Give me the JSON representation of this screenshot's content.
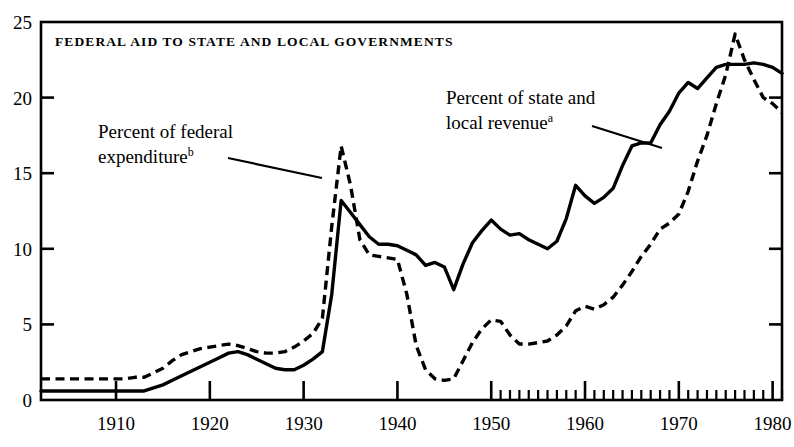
{
  "chart_data": {
    "type": "line",
    "title": "FEDERAL AID TO STATE AND LOCAL GOVERNMENTS",
    "xlabel": "",
    "ylabel": "",
    "xlim": [
      1902,
      1981
    ],
    "ylim": [
      0,
      25
    ],
    "grid": false,
    "legend_position": "inline-annotations",
    "y_ticks": [
      0,
      5,
      10,
      15,
      20,
      25
    ],
    "y_tick_labels": [
      "0",
      "5",
      "10",
      "15",
      "20",
      "25"
    ],
    "x_ticks_major": [
      1910,
      1920,
      1930,
      1940,
      1950,
      1960,
      1970,
      1980
    ],
    "x_tick_labels": [
      "1910",
      "1920",
      "1930",
      "1940",
      "1950",
      "1960",
      "1970",
      "1980"
    ],
    "x_minor_ticks_note": "annual minor ticks from 1950 to 1981",
    "x_minor_tick_start": 1950,
    "x_minor_tick_end": 1981,
    "annotations": [
      {
        "name": "percent-of-federal-expenditure",
        "line1": "Percent of federal",
        "line2": "expenditure",
        "superscript": "b",
        "series_ref": "percent_of_federal_expenditure"
      },
      {
        "name": "percent-of-state-and-local-revenue",
        "line1": "Percent of state and",
        "line2": "local revenue",
        "superscript": "a",
        "series_ref": "percent_of_state_and_local_revenue"
      }
    ],
    "series": [
      {
        "name": "percent_of_state_and_local_revenue",
        "label": "Percent of state and local revenue",
        "style": "solid",
        "color": "#000000",
        "x": [
          1902,
          1903,
          1904,
          1905,
          1906,
          1907,
          1908,
          1909,
          1910,
          1911,
          1912,
          1913,
          1914,
          1915,
          1916,
          1917,
          1918,
          1919,
          1920,
          1921,
          1922,
          1923,
          1924,
          1925,
          1926,
          1927,
          1928,
          1929,
          1930,
          1931,
          1932,
          1933,
          1934,
          1935,
          1936,
          1937,
          1938,
          1939,
          1940,
          1941,
          1942,
          1943,
          1944,
          1945,
          1946,
          1947,
          1948,
          1949,
          1950,
          1951,
          1952,
          1953,
          1954,
          1955,
          1956,
          1957,
          1958,
          1959,
          1960,
          1961,
          1962,
          1963,
          1964,
          1965,
          1966,
          1967,
          1968,
          1969,
          1970,
          1971,
          1972,
          1973,
          1974,
          1975,
          1976,
          1977,
          1978,
          1979,
          1980,
          1981
        ],
        "y": [
          0.6,
          0.6,
          0.6,
          0.6,
          0.6,
          0.6,
          0.6,
          0.6,
          0.6,
          0.6,
          0.6,
          0.6,
          0.8,
          1.0,
          1.3,
          1.6,
          1.9,
          2.2,
          2.5,
          2.8,
          3.1,
          3.2,
          3.0,
          2.7,
          2.4,
          2.1,
          2.0,
          2.0,
          2.3,
          2.7,
          3.2,
          7.0,
          13.2,
          12.4,
          11.6,
          10.8,
          10.3,
          10.3,
          10.2,
          9.9,
          9.6,
          8.9,
          9.1,
          8.8,
          7.3,
          9.0,
          10.4,
          11.2,
          11.9,
          11.3,
          10.9,
          11.0,
          10.6,
          10.3,
          10.0,
          10.5,
          12.0,
          14.2,
          13.5,
          13.0,
          13.4,
          14.0,
          15.5,
          16.8,
          17.0,
          17.0,
          18.2,
          19.1,
          20.3,
          21.0,
          20.6,
          21.3,
          22.0,
          22.2,
          22.2,
          22.2,
          22.3,
          22.2,
          22.0,
          21.6
        ]
      },
      {
        "name": "percent_of_federal_expenditure",
        "label": "Percent of federal expenditure",
        "style": "dashed",
        "color": "#000000",
        "x": [
          1902,
          1903,
          1904,
          1905,
          1906,
          1907,
          1908,
          1909,
          1910,
          1911,
          1912,
          1913,
          1914,
          1915,
          1916,
          1917,
          1918,
          1919,
          1920,
          1921,
          1922,
          1923,
          1924,
          1925,
          1926,
          1927,
          1928,
          1929,
          1930,
          1931,
          1932,
          1933,
          1934,
          1935,
          1936,
          1937,
          1938,
          1939,
          1940,
          1941,
          1942,
          1943,
          1944,
          1945,
          1946,
          1947,
          1948,
          1949,
          1950,
          1951,
          1952,
          1953,
          1954,
          1955,
          1956,
          1957,
          1958,
          1959,
          1960,
          1961,
          1962,
          1963,
          1964,
          1965,
          1966,
          1967,
          1968,
          1969,
          1970,
          1971,
          1972,
          1973,
          1974,
          1975,
          1976,
          1977,
          1978,
          1979,
          1980,
          1981
        ],
        "y": [
          1.4,
          1.4,
          1.4,
          1.4,
          1.4,
          1.4,
          1.4,
          1.4,
          1.4,
          1.4,
          1.5,
          1.5,
          1.8,
          2.1,
          2.6,
          3.0,
          3.2,
          3.4,
          3.5,
          3.6,
          3.7,
          3.6,
          3.4,
          3.2,
          3.1,
          3.1,
          3.2,
          3.5,
          3.9,
          4.4,
          5.4,
          11.5,
          16.8,
          14.2,
          10.6,
          9.6,
          9.5,
          9.4,
          9.3,
          7.0,
          3.6,
          2.0,
          1.4,
          1.3,
          1.4,
          2.6,
          3.8,
          4.7,
          5.3,
          5.2,
          4.3,
          3.7,
          3.7,
          3.8,
          3.9,
          4.3,
          4.9,
          5.9,
          6.2,
          6.0,
          6.3,
          6.8,
          7.6,
          8.5,
          9.5,
          10.3,
          11.3,
          11.7,
          12.3,
          13.8,
          15.8,
          17.5,
          19.6,
          21.5,
          24.2,
          22.5,
          21.2,
          20.0,
          19.6,
          19.0
        ]
      }
    ]
  }
}
